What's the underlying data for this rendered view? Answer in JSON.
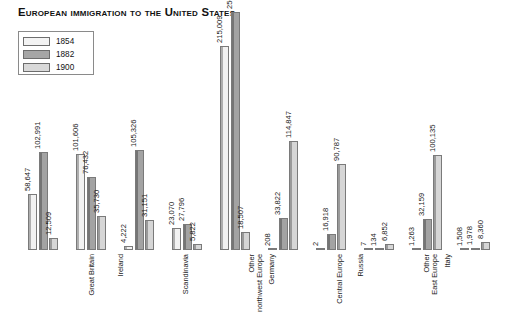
{
  "chart_title": "European immigration to the United States",
  "legend": {
    "position": "top-left",
    "entries": [
      {
        "label": "1854",
        "color": "#f2f2f2",
        "swatch": "swatch-1854"
      },
      {
        "label": "1882",
        "color": "#a3a3a3",
        "swatch": "swatch-1882"
      },
      {
        "label": "1900",
        "color": "#d6d6d6",
        "swatch": "swatch-1900"
      }
    ]
  },
  "chart_data": {
    "type": "bar",
    "title": "European immigration to the United States",
    "xlabel": "",
    "ylabel": "",
    "ylim": [
      0,
      250630
    ],
    "grid": false,
    "legend_position": "top-left",
    "categories": [
      "Great Britain",
      "Ireland",
      "Scandinavia",
      "Other northwest Europe",
      "Germany",
      "Central Europe",
      "Russia",
      "Other East Europe",
      "Italy",
      "Other southern Europe"
    ],
    "series": [
      {
        "name": "1854",
        "color": "#f2f2f2",
        "values": [
          58647,
          101606,
          4222,
          23070,
          215009,
          208,
          2,
          7,
          1263,
          1508
        ],
        "labels": [
          "58,647",
          "101,606",
          "4,222",
          "23,070",
          "215,009",
          "208",
          "2",
          "7",
          "1,263",
          "1,508"
        ]
      },
      {
        "name": "1882",
        "color": "#a3a3a3",
        "values": [
          102991,
          76432,
          105326,
          27796,
          250630,
          33822,
          16918,
          134,
          32159,
          1978
        ],
        "labels": [
          "102,991",
          "76,432",
          "105,326",
          "27,796",
          "250,630",
          "33,822",
          "16,918",
          "134",
          "32,159",
          "1,978"
        ]
      },
      {
        "name": "1900",
        "color": "#d6d6d6",
        "values": [
          12509,
          35730,
          31151,
          5822,
          18507,
          114847,
          90787,
          6852,
          100135,
          8360
        ],
        "labels": [
          "12,509",
          "35,730",
          "31,151",
          "5,822",
          "18,507",
          "114,847",
          "90,787",
          "6,852",
          "100,135",
          "8,360"
        ]
      }
    ]
  }
}
